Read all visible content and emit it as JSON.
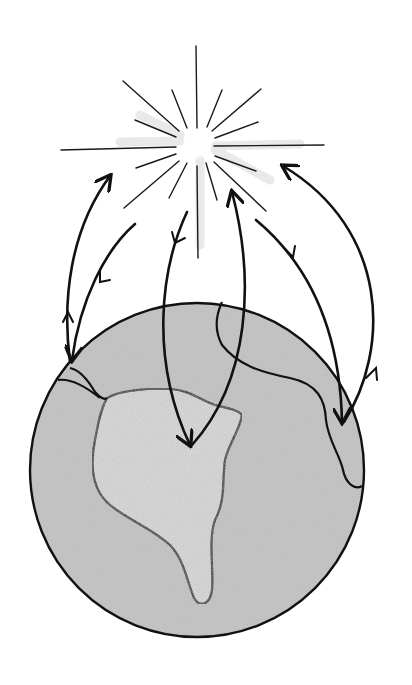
{
  "illustration": {
    "subject": "Pencil sketch of the Sun radiating energy toward Earth, with curved arrows showing energy traveling from the Sun to Earth and back",
    "style": "hand-drawn pencil, grayscale",
    "colors": {
      "background": "#ffffff",
      "ink": "#111111",
      "earth_fill": "#c9c9c9",
      "continent_fill": "#dedede",
      "sun_glow": "#e6e6e6"
    },
    "sun": {
      "cx": 197,
      "cy": 143,
      "ray_count": 16
    },
    "earth": {
      "cx": 197,
      "cy": 470,
      "r": 167
    },
    "arrows": [
      {
        "direction": "earth-to-sun",
        "from": "left-limb",
        "to": "sun-lower-left"
      },
      {
        "direction": "sun-to-earth",
        "from": "sun-lower-left",
        "to": "left-limb"
      },
      {
        "direction": "sun-to-earth",
        "from": "sun-below",
        "to": "continent-center"
      },
      {
        "direction": "earth-to-sun",
        "from": "continent-center",
        "to": "sun-lower-right"
      },
      {
        "direction": "sun-to-earth",
        "from": "sun-lower-right",
        "to": "right-limb"
      },
      {
        "direction": "earth-to-sun",
        "from": "right-limb",
        "to": "sun-far-right"
      }
    ]
  }
}
